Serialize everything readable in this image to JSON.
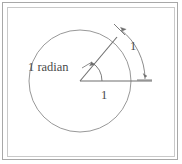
{
  "figure": {
    "labels": {
      "angle_label": "1 radian",
      "radius_label": "1",
      "arc_label": "1"
    },
    "colors": {
      "stroke": "#7a7a7a",
      "circle_stroke": "#8c8c8c",
      "text": "#4a4a4a",
      "outer_border": "#a8a8a8",
      "inner_border": "#c9c9c9",
      "background": "#ffffff"
    },
    "geometry": {
      "center_x": 80,
      "center_y": 81,
      "radius": 51,
      "angle_degrees": 57.3,
      "angle_radians": 1
    }
  }
}
